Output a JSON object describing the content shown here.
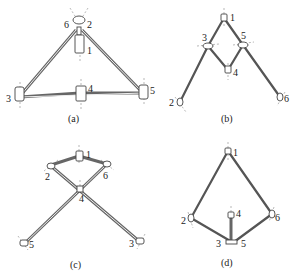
{
  "panels": [
    {
      "id": "a",
      "caption": "(a)",
      "labels": {
        "n1": "1",
        "n2": "2",
        "n3": "3",
        "n4": "4",
        "n5": "5",
        "n6": "6"
      }
    },
    {
      "id": "b",
      "caption": "(b)",
      "labels": {
        "n1": "1",
        "n2": "2",
        "n3": "3",
        "n4": "4",
        "n5": "5",
        "n6": "6"
      }
    },
    {
      "id": "c",
      "caption": "(c)",
      "labels": {
        "n1": "1",
        "n2": "2",
        "n3": "3",
        "n4": "4",
        "n5": "5",
        "n6": "6"
      }
    },
    {
      "id": "d",
      "caption": "(d)",
      "labels": {
        "n1": "1",
        "n2": "2",
        "n3": "3",
        "n4": "4",
        "n5": "5",
        "n6": "6"
      }
    }
  ]
}
